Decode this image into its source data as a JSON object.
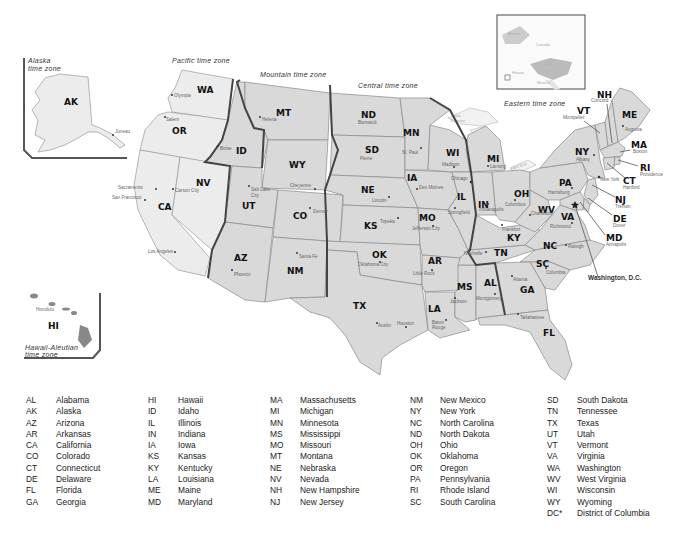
{
  "map": {
    "time_zones": {
      "alaska": [
        "Alaska",
        "time zone"
      ],
      "pacific": "Pacific time zone",
      "mountain": "Mountain time zone",
      "central": "Central time zone",
      "eastern": "Eastern time zone",
      "hawaii": [
        "Hawaii-Aleutian",
        "time zone"
      ]
    },
    "states": {
      "AK": "AK",
      "HI": "HI",
      "WA": "WA",
      "OR": "OR",
      "CA": "CA",
      "NV": "NV",
      "ID": "ID",
      "MT": "MT",
      "WY": "WY",
      "UT": "UT",
      "CO": "CO",
      "AZ": "AZ",
      "NM": "NM",
      "ND": "ND",
      "SD": "SD",
      "NE": "NE",
      "KS": "KS",
      "OK": "OK",
      "TX": "TX",
      "MN": "MN",
      "IA": "IA",
      "MO": "MO",
      "AR": "AR",
      "LA": "LA",
      "WI": "WI",
      "IL": "IL",
      "MS": "MS",
      "AL": "AL",
      "TN": "TN",
      "KY": "KY",
      "IN": "IN",
      "MI": "MI",
      "OH": "OH",
      "WV": "WV",
      "VA": "VA",
      "NC": "NC",
      "SC": "SC",
      "GA": "GA",
      "FL": "FL",
      "PA": "PA",
      "NY": "NY",
      "VT": "VT",
      "NH": "NH",
      "ME": "ME",
      "MA": "MA",
      "RI": "RI",
      "CT": "CT",
      "NJ": "NJ",
      "DE": "DE",
      "MD": "MD"
    },
    "capitals": {
      "juneau": "Juneau",
      "honolulu": "Honolulu",
      "olympia": "Olympia",
      "salem": "Salem",
      "sacramento": "Sacramento",
      "san_francisco": "San Francisco",
      "los_angeles": "Los Angeles",
      "carson_city": "Carson City",
      "boise": "Boise",
      "helena": "Helena",
      "cheyenne": "Cheyenne",
      "salt_lake_city": [
        "Salt Lake",
        "City"
      ],
      "denver": "Denver",
      "phoenix": "Phoenix",
      "santa_fe": "Santa Fe",
      "bismarck": "Bismarck",
      "pierre": "Pierre",
      "lincoln": "Lincoln",
      "topeka": "Topeka",
      "oklahoma_city": "Oklahoma City",
      "austin": "Austin",
      "houston": "Houston",
      "st_paul": "St. Paul",
      "des_moines": "Des Moines",
      "jefferson_city": "Jefferson City",
      "little_rock": "Little Rock",
      "baton_rouge": [
        "Baton",
        "Rouge"
      ],
      "madison": "Madison",
      "chicago": "Chicago",
      "springfield": "Springfield",
      "jackson": "Jackson",
      "montgomery": "Montgomery",
      "nashville": "Nashville",
      "frankfort": "Frankfort",
      "indianapolis": "Indianapolis",
      "lansing": "Lansing",
      "columbus": "Columbus",
      "charleston": "Charleston",
      "richmond": "Richmond",
      "raleigh": "Raleigh",
      "columbia": "Columbia",
      "atlanta": "Atlanta",
      "tallahassee": "Tallahassee",
      "harrisburg": "Harrisburg",
      "albany": "Albany",
      "new_york": "New York",
      "montpelier": "Montpelier",
      "concord": "Concord",
      "augusta": "Augusta",
      "boston": "Boston",
      "providence": "Providence",
      "hartford": "Hartford",
      "trenton": "Trenton",
      "dover": "Dover",
      "annapolis": "Annapolis"
    },
    "washington_dc": "Washington, D.C.",
    "lakes": {
      "superior": [
        "Lake",
        "Superior"
      ],
      "michigan": [
        "Lake",
        "Michigan"
      ],
      "huron": [
        "Lake",
        "Huron"
      ],
      "erie": "Lake Erie",
      "ontario": "Lake Ontario"
    },
    "locator": {
      "alaska": "Alaska",
      "canada": "Canada",
      "us": "U.S.",
      "hawaii": "Hawaii",
      "mexico": "Mexico"
    }
  },
  "legend": {
    "columns": [
      [
        {
          "abbr": "AL",
          "name": "Alabama"
        },
        {
          "abbr": "AK",
          "name": "Alaska"
        },
        {
          "abbr": "AZ",
          "name": "Arizona"
        },
        {
          "abbr": "AR",
          "name": "Arkansas"
        },
        {
          "abbr": "CA",
          "name": "California"
        },
        {
          "abbr": "CO",
          "name": "Colorado"
        },
        {
          "abbr": "CT",
          "name": "Connecticut"
        },
        {
          "abbr": "DE",
          "name": "Delaware"
        },
        {
          "abbr": "FL",
          "name": "Florida"
        },
        {
          "abbr": "GA",
          "name": "Georgia"
        }
      ],
      [
        {
          "abbr": "HI",
          "name": "Hawaii"
        },
        {
          "abbr": "ID",
          "name": "Idaho"
        },
        {
          "abbr": "IL",
          "name": "Illinois"
        },
        {
          "abbr": "IN",
          "name": "Indiana"
        },
        {
          "abbr": "IA",
          "name": "Iowa"
        },
        {
          "abbr": "KS",
          "name": "Kansas"
        },
        {
          "abbr": "KY",
          "name": "Kentucky"
        },
        {
          "abbr": "LA",
          "name": "Louisiana"
        },
        {
          "abbr": "ME",
          "name": "Maine"
        },
        {
          "abbr": "MD",
          "name": "Maryland"
        }
      ],
      [
        {
          "abbr": "MA",
          "name": "Massachusetts"
        },
        {
          "abbr": "MI",
          "name": "Michigan"
        },
        {
          "abbr": "MN",
          "name": "Minnesota"
        },
        {
          "abbr": "MS",
          "name": "Mississippi"
        },
        {
          "abbr": "MO",
          "name": "Missouri"
        },
        {
          "abbr": "MT",
          "name": "Montana"
        },
        {
          "abbr": "NE",
          "name": "Nebraska"
        },
        {
          "abbr": "NV",
          "name": "Nevada"
        },
        {
          "abbr": "NH",
          "name": "New Hampshire"
        },
        {
          "abbr": "NJ",
          "name": "New Jersey"
        }
      ],
      [
        {
          "abbr": "NM",
          "name": "New Mexico"
        },
        {
          "abbr": "NY",
          "name": "New York"
        },
        {
          "abbr": "NC",
          "name": "North Carolina"
        },
        {
          "abbr": "ND",
          "name": "North Dakota"
        },
        {
          "abbr": "OH",
          "name": "Ohio"
        },
        {
          "abbr": "OK",
          "name": "Oklahoma"
        },
        {
          "abbr": "OR",
          "name": "Oregon"
        },
        {
          "abbr": "PA",
          "name": "Pennsylvania"
        },
        {
          "abbr": "RI",
          "name": "Rhode Island"
        },
        {
          "abbr": "SC",
          "name": "South Carolina"
        }
      ],
      [
        {
          "abbr": "SD",
          "name": "South Dakota"
        },
        {
          "abbr": "TN",
          "name": "Tennessee"
        },
        {
          "abbr": "TX",
          "name": "Texas"
        },
        {
          "abbr": "UT",
          "name": "Utah"
        },
        {
          "abbr": "VT",
          "name": "Vermont"
        },
        {
          "abbr": "VA",
          "name": "Virginia"
        },
        {
          "abbr": "WA",
          "name": "Washington"
        },
        {
          "abbr": "WV",
          "name": "West Virginia"
        },
        {
          "abbr": "WI",
          "name": "Wisconsin"
        },
        {
          "abbr": "WY",
          "name": "Wyoming"
        },
        {
          "abbr": "DC*",
          "name": "District of Columbia"
        }
      ]
    ]
  }
}
